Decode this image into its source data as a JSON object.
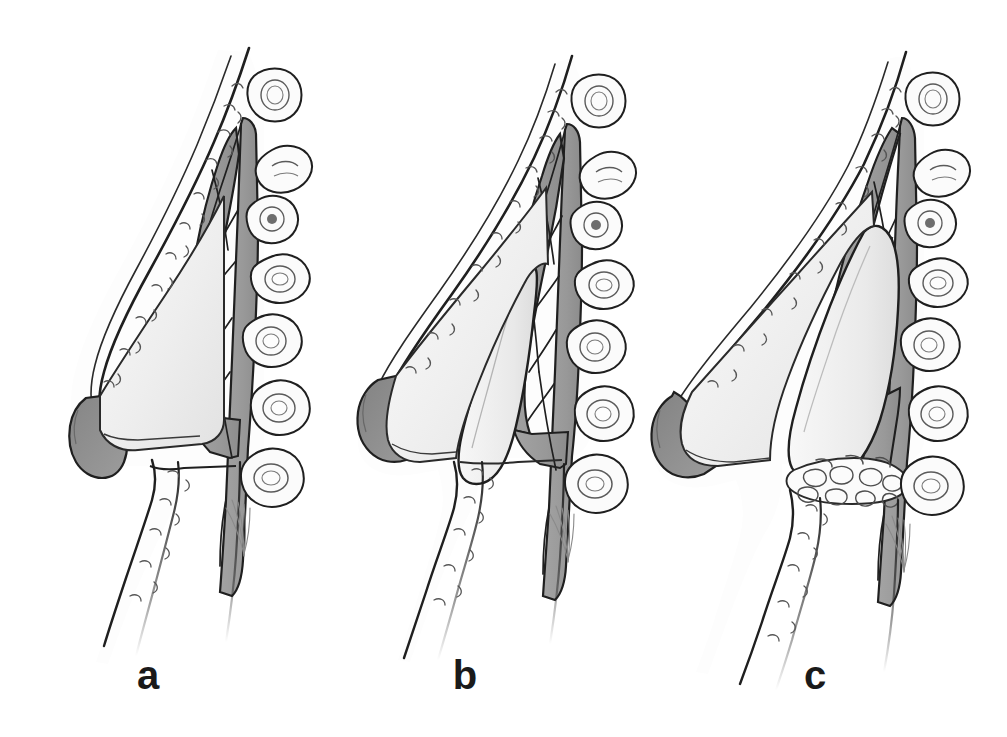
{
  "figure": {
    "kind": "medical-illustration",
    "background_color": "#ffffff",
    "panel_count": 3
  },
  "palette": {
    "background": "#ffffff",
    "ink_outline": "#1f1f1f",
    "ink_fine": "#4a4a4a",
    "cartilage_gray": "#9a9a9a",
    "cartilage_gray_dark": "#8a8a8a",
    "tip_cap_gray": "#8e8e8e",
    "graft_light": "#ececec",
    "soft_tissue_light": "#f3f3f3",
    "skin_white": "#fcfcfc",
    "label_color": "#1a1a1a"
  },
  "panels": [
    {
      "id": "a",
      "label": "a",
      "caption": "a",
      "stage": "pre-operative profile, no graft",
      "features": [
        "skin-soft-tissue-envelope",
        "septal-cartilage-block",
        "nasal-tip-cap",
        "turbinate-ovals",
        "columella-base",
        "nasal-floor"
      ],
      "turbinate_count": 6,
      "graft_present": false
    },
    {
      "id": "b",
      "label": "b",
      "caption": "b",
      "stage": "dorsal graft placed, projection increased",
      "features": [
        "skin-soft-tissue-envelope",
        "septal-cartilage-block",
        "nasal-tip-cap",
        "dorsal-onlay-graft",
        "turbinate-ovals",
        "columella-base",
        "nasal-floor"
      ],
      "turbinate_count": 6,
      "graft_present": true
    },
    {
      "id": "c",
      "label": "c",
      "caption": "c",
      "stage": "dorsal graft plus tip and base augmentation",
      "features": [
        "skin-soft-tissue-envelope",
        "septal-cartilage-block",
        "nasal-tip-cap",
        "dorsal-onlay-graft",
        "base-fat-graft-texture",
        "turbinate-ovals",
        "columella-base",
        "nasal-floor"
      ],
      "turbinate_count": 6,
      "graft_present": true
    }
  ],
  "labels": {
    "a": "a",
    "b": "b",
    "c": "c"
  }
}
